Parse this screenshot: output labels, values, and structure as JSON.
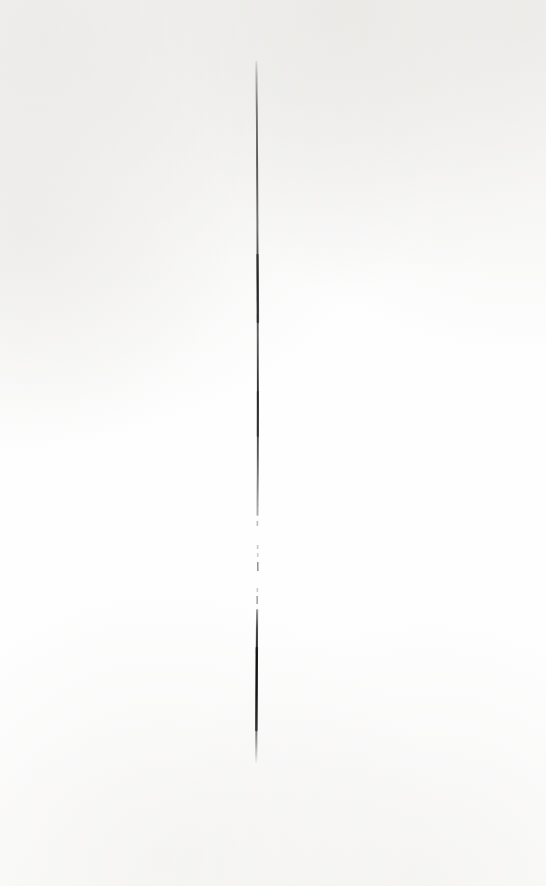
{
  "page": {
    "width": 546,
    "height": 886,
    "background_color": "#fefefe",
    "paper_tint_color": "#fdfdfc",
    "visible_text": "",
    "alt_text": "A single thin near-vertical ink line drawn down the middle of an otherwise blank white page."
  },
  "artwork": {
    "name": "vertical-ink-stroke",
    "ink_color": "#1a1a1a",
    "ink_color_light": "#9a9a9a",
    "orientation": "vertical",
    "top_y": 62,
    "bottom_y": 762,
    "center_x": 257,
    "max_stroke_width": 2.2,
    "segments": [
      {
        "name": "upper-solid",
        "from_y": 62,
        "to_y": 515,
        "style": "solid",
        "opacity_start": 0.18,
        "opacity_end": 0.92
      },
      {
        "name": "middle-broken",
        "from_y": 515,
        "to_y": 610,
        "style": "dashed",
        "opacity_start": 0.3,
        "opacity_end": 0.45
      },
      {
        "name": "lower-solid",
        "from_y": 610,
        "to_y": 762,
        "style": "solid",
        "opacity_start": 0.7,
        "opacity_end": 0.05
      }
    ],
    "dashes": [
      {
        "y": 521,
        "height": 5,
        "opacity": 0.3,
        "x": 257.4
      },
      {
        "y": 545,
        "height": 4,
        "opacity": 0.26,
        "x": 257.6
      },
      {
        "y": 553,
        "height": 4,
        "opacity": 0.22,
        "x": 257.7
      },
      {
        "y": 562,
        "height": 9,
        "opacity": 0.48,
        "x": 257.8
      },
      {
        "y": 588,
        "height": 4,
        "opacity": 0.24,
        "x": 257.4
      },
      {
        "y": 596,
        "height": 8,
        "opacity": 0.4,
        "x": 257.2
      }
    ],
    "path_points": [
      {
        "y": 62,
        "x": 256.4
      },
      {
        "y": 120,
        "x": 256.9
      },
      {
        "y": 200,
        "x": 257.3
      },
      {
        "y": 300,
        "x": 257.7
      },
      {
        "y": 400,
        "x": 257.9
      },
      {
        "y": 470,
        "x": 257.8
      },
      {
        "y": 515,
        "x": 257.5
      },
      {
        "y": 610,
        "x": 257.1
      },
      {
        "y": 690,
        "x": 256.6
      },
      {
        "y": 762,
        "x": 256.2
      }
    ]
  }
}
